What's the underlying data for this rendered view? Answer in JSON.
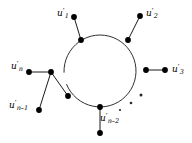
{
  "figure": {
    "kind": "graph-diagram",
    "width": 192,
    "height": 143,
    "background_color": "#ffffff",
    "stroke_color": "#1a1a1a",
    "node_fill_color": "#000000"
  },
  "chart_data": {
    "type": "diagram",
    "title": "",
    "cycle": {
      "center_x": 100,
      "center_y": 71,
      "radius": 36,
      "gap_start_deg": 158,
      "gap_end_deg": 178
    },
    "cycle_nodes": [
      {
        "id": "c1",
        "x": 81,
        "y": 40,
        "angle_deg": 238
      },
      {
        "id": "c2",
        "x": 128,
        "y": 40,
        "angle_deg": 302
      },
      {
        "id": "c3",
        "x": 146,
        "y": 70,
        "angle_deg": 359
      },
      {
        "id": "c4",
        "x": 100,
        "y": 107,
        "angle_deg": 90
      },
      {
        "id": "c5",
        "x": 68,
        "y": 96,
        "angle_deg": 133
      }
    ],
    "pendant_nodes": [
      {
        "id": "p1",
        "x": 74,
        "y": 17,
        "label_key": "u_1"
      },
      {
        "id": "p2",
        "x": 140,
        "y": 16,
        "label_key": "u_2"
      },
      {
        "id": "p3",
        "x": 165,
        "y": 70,
        "label_key": "u_3"
      },
      {
        "id": "p4",
        "x": 100,
        "y": 133,
        "label_key": "u_n_minus_2"
      },
      {
        "id": "p5",
        "x": 51,
        "y": 72,
        "label_key": "u_n_chain"
      },
      {
        "id": "p6",
        "x": 29,
        "y": 72,
        "label_key": "u_n"
      },
      {
        "id": "p7",
        "x": 39,
        "y": 110,
        "label_key": "u_n_minus_1"
      }
    ],
    "edges": [
      {
        "from": "p1",
        "to": "c1"
      },
      {
        "from": "p2",
        "to": "c2"
      },
      {
        "from": "p3",
        "to": "c3"
      },
      {
        "from": "p4",
        "to": "c4"
      },
      {
        "from": "c5",
        "to": "p5"
      },
      {
        "from": "p5",
        "to": "p6"
      },
      {
        "from": "p5",
        "to": "p7"
      }
    ],
    "ellipsis_dots": [
      {
        "x": 120,
        "y": 110,
        "r": 1.1
      },
      {
        "x": 131,
        "y": 103,
        "r": 1.3
      },
      {
        "x": 141,
        "y": 95,
        "r": 1.5
      }
    ]
  },
  "labels": {
    "u_1": {
      "base": "u",
      "prime": "′",
      "sub": "1",
      "x": 57,
      "y": 9
    },
    "u_2": {
      "base": "u",
      "prime": "′",
      "sub": "2",
      "x": 146,
      "y": 9
    },
    "u_3": {
      "base": "u",
      "prime": "′",
      "sub": "3",
      "x": 172,
      "y": 65
    },
    "u_n": {
      "base": "u",
      "prime": "′",
      "sub": "n",
      "x": 11,
      "y": 62
    },
    "u_n_minus_1": {
      "base": "u",
      "prime": "′",
      "sub": "n–1",
      "x": 9,
      "y": 101
    },
    "u_n_minus_2": {
      "base": "u",
      "prime": "′",
      "sub": "n–2",
      "x": 100,
      "y": 114
    }
  }
}
